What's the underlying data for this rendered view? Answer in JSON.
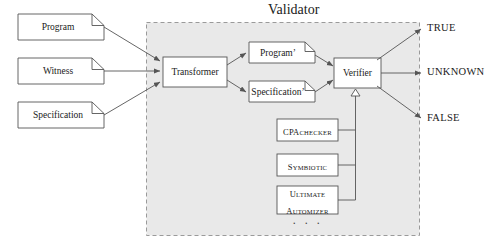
{
  "diagram": {
    "title": "Validator",
    "background_color": "#ffffff",
    "region_fill": "#e9e9e9",
    "region_border_color": "#9a9a9a",
    "line_color": "#555555",
    "box_fill": "#ffffff",
    "box_border_color": "#555555",
    "text_color": "#1a1a1a"
  },
  "inputs": [
    {
      "name": "program",
      "label": "Program"
    },
    {
      "name": "witness",
      "label": "Witness"
    },
    {
      "name": "specification",
      "label": "Specification"
    }
  ],
  "validator": {
    "title": "Validator",
    "transformer": {
      "label": "Transformer"
    },
    "artifacts": [
      {
        "name": "program-prime",
        "label": "Program’"
      },
      {
        "name": "specification-prime",
        "label": "Specification’"
      }
    ],
    "verifier": {
      "label": "Verifier"
    },
    "tools": [
      {
        "name": "cpachecker",
        "head": "CPA",
        "tail": "CHECKER",
        "lines": 1
      },
      {
        "name": "symbiotic",
        "head": "S",
        "tail": "YMBIOTIC",
        "lines": 1
      },
      {
        "name": "ultimate-automizer",
        "head": "U",
        "tail": "LTIMATE",
        "head2": "A",
        "tail2": "UTOMIZER",
        "lines": 2
      }
    ],
    "tools_more": "· · ·"
  },
  "outputs": [
    {
      "name": "true",
      "label": "TRUE"
    },
    {
      "name": "unknown",
      "label": "UNKNOWN"
    },
    {
      "name": "false",
      "label": "FALSE"
    }
  ]
}
